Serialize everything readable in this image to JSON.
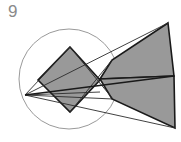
{
  "figure": {
    "label": "9",
    "label_color": "#8a8a8a",
    "background_color": "#ffffff",
    "type": "geometric-construction-diagram"
  },
  "style": {
    "fill_gray": "#999999",
    "stroke_dark": "#1a1a1a",
    "stroke_circle": "#9a9a9a",
    "stroke_thin": "#2b2b2b",
    "stroke_width_shape": 1.6,
    "stroke_width_circle": 1.0,
    "stroke_width_thin": 0.9
  },
  "shapes": {
    "circle": {
      "name": "construction-circle",
      "cx": 69,
      "cy": 79,
      "r": 50,
      "fill": "none",
      "stroke": "#9a9a9a"
    },
    "rhombus": {
      "name": "shaded-rhombus",
      "points": "70,47 100,80 70,112 38,80",
      "fill": "#999999",
      "stroke": "#1a1a1a"
    },
    "wedge_upper": {
      "name": "arrow-wedge-upper",
      "points": "168,23 174,76 100,79 112,60",
      "fill": "#999999",
      "stroke": "#1a1a1a"
    },
    "wedge_lower": {
      "name": "arrow-wedge-lower",
      "points": "174,76 175,128 112,99 100,79",
      "fill": "#999999",
      "stroke": "#1a1a1a"
    }
  },
  "lines": {
    "axis": {
      "name": "horizontal-axis-line",
      "x1": 25,
      "y1": 95,
      "x2": 174,
      "y2": 76
    },
    "ray_upper_right": {
      "name": "ray-left-vertex-to-upper-right",
      "x1": 25,
      "y1": 95,
      "x2": 168,
      "y2": 23
    },
    "ray_lower_right": {
      "name": "ray-left-vertex-to-lower-right",
      "x1": 25,
      "y1": 95,
      "x2": 175,
      "y2": 128
    },
    "ray_mid": {
      "name": "ray-left-vertex-to-center",
      "x1": 25,
      "y1": 95,
      "x2": 100,
      "y2": 79
    },
    "chord_upper": {
      "name": "chord-upper",
      "x1": 25,
      "y1": 95,
      "x2": 70,
      "y2": 47
    },
    "chord_lower": {
      "name": "chord-lower",
      "x1": 25,
      "y1": 95,
      "x2": 113,
      "y2": 99
    },
    "cross_a": {
      "name": "cross-line-upper-to-lower",
      "x1": 70,
      "y1": 47,
      "x2": 113,
      "y2": 99
    },
    "cross_b": {
      "name": "cross-line-lower-to-upper",
      "x1": 70,
      "y1": 112,
      "x2": 112,
      "y2": 60
    },
    "baseline": {
      "name": "baseline-left",
      "x1": 25,
      "y1": 95,
      "x2": 100,
      "y2": 92
    }
  },
  "vertices": {
    "left_apex": {
      "name": "left-apex-point",
      "x": 25,
      "y": 95
    },
    "center_node": {
      "name": "center-convergence-point",
      "x": 100,
      "y": 79
    },
    "rhombus_top": {
      "name": "rhombus-top-vertex",
      "x": 70,
      "y": 47
    },
    "rhombus_bottom": {
      "name": "rhombus-bottom-vertex",
      "x": 70,
      "y": 112
    },
    "wedge_tip": {
      "name": "wedge-notch-tip",
      "x": 100,
      "y": 79
    }
  }
}
